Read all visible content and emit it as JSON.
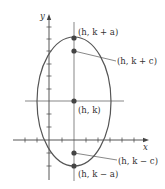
{
  "diagram": {
    "type": "vertical-ellipse",
    "axes": {
      "x_label": "x",
      "y_label": "y"
    },
    "center": {
      "label": "(h, k)"
    },
    "vertices": [
      {
        "label": "(h, k + a)",
        "position": "top"
      },
      {
        "label": "(h, k − a)",
        "position": "bottom"
      }
    ],
    "foci": [
      {
        "label": "(h, k + c)",
        "position": "upper"
      },
      {
        "label": "(h, k − c)",
        "position": "lower"
      }
    ],
    "colors": {
      "stroke": "#555555",
      "points": "#444444",
      "text": "#333333",
      "background": "#ffffff"
    }
  }
}
